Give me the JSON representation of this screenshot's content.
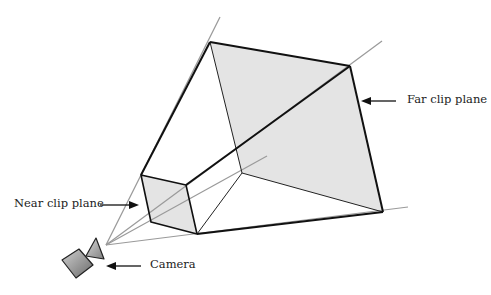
{
  "diagram": {
    "type": "view-frustum",
    "labels": {
      "far_clip_plane": "Far clip plane",
      "near_clip_plane": "Near clip plane",
      "camera": "Camera"
    },
    "colors": {
      "edge": "#111111",
      "ray": "#9a9a9a",
      "plane_fill": "#e4e4e4",
      "camera_fill_light": "#c8c8c8",
      "camera_fill_dark": "#707070",
      "text": "#222222"
    }
  }
}
